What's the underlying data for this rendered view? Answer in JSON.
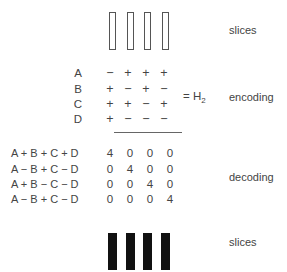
{
  "top": {
    "label": "slices",
    "slice_count": 4,
    "slice_style": "outline"
  },
  "encoding": {
    "row_labels": [
      "A",
      "B",
      "C",
      "D"
    ],
    "matrix": [
      [
        "−",
        "+",
        "+",
        "+"
      ],
      [
        "+",
        "−",
        "+",
        "−"
      ],
      [
        "+",
        "+",
        "−",
        "+"
      ],
      [
        "+",
        "−",
        "−",
        "−"
      ]
    ],
    "equals": "= H",
    "subscript": "2",
    "label": "encoding"
  },
  "decoding": {
    "row_labels": [
      "A + B + C + D",
      "A − B + C − D",
      "A + B − C − D",
      "A − B + C − D"
    ],
    "matrix": [
      [
        "4",
        "0",
        "0",
        "0"
      ],
      [
        "0",
        "4",
        "0",
        "0"
      ],
      [
        "0",
        "0",
        "4",
        "0"
      ],
      [
        "0",
        "0",
        "0",
        "4"
      ]
    ],
    "label": "decoding"
  },
  "bottom": {
    "label": "slices",
    "slice_count": 4,
    "slice_style": "solid"
  }
}
